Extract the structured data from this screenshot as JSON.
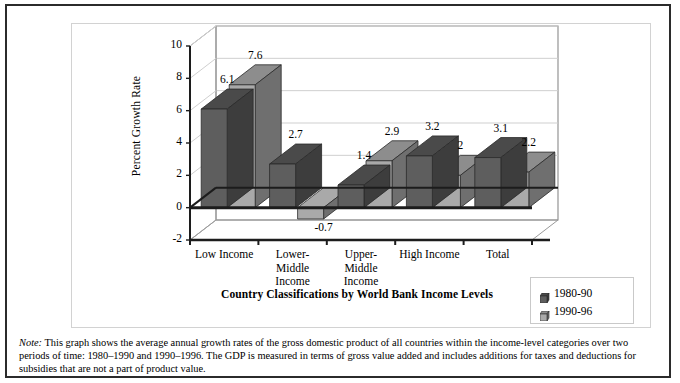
{
  "figure": {
    "note_prefix": "Note:",
    "note_text": " This graph shows the average annual growth rates of the gross domestic product of all countries within the income-level categories over two periods of time: 1980–1990 and 1990–1996. The GDP is measured in terms of gross value added and includes additions for taxes and deductions for subsidies that are not a part of product value."
  },
  "colors": {
    "series1_front": "#5e5e5e",
    "series1_top": "#4a4a4a",
    "series1_side": "#3d3d3d",
    "series2_front": "#a9a9a9",
    "series2_top": "#8d8d8d",
    "series2_side": "#6f6f6f",
    "axis": "#1c1c1c",
    "grid": "#cfcfcf",
    "wall": "#ffffff",
    "frame": "#2b2b2b"
  },
  "chart_data": {
    "type": "bar",
    "title": "Country Classifications by World Bank Income Levels",
    "xlabel": "Country Classifications by World Bank Income Levels",
    "ylabel": "Percent Growth Rate",
    "ylim": [
      -2,
      10
    ],
    "ytick_step": 2,
    "yticks": [
      "10",
      "8",
      "6",
      "4",
      "2",
      "0",
      "-2"
    ],
    "ytick_values": [
      10,
      8,
      6,
      4,
      2,
      0,
      -2
    ],
    "grid": true,
    "legend_position": "bottom-right",
    "categories": [
      "Low Income",
      "Lower-Middle Income",
      "Upper-Middle Income",
      "High Income",
      "Total"
    ],
    "category_label_lines": [
      [
        "Low Income"
      ],
      [
        "Lower-",
        "Middle",
        "Income"
      ],
      [
        "Upper-",
        "Middle",
        "Income"
      ],
      [
        "High Income"
      ],
      [
        "Total"
      ]
    ],
    "series": [
      {
        "name": "1980-90",
        "values": [
          6.1,
          2.7,
          1.4,
          3.2,
          3.1
        ],
        "labels": [
          "6.1",
          "2.7",
          "1.4",
          "3.2",
          "3.1"
        ]
      },
      {
        "name": "1990-96",
        "values": [
          7.6,
          -0.7,
          2.9,
          2.0,
          2.2
        ],
        "labels": [
          "7.6",
          "-0.7",
          "2.9",
          "2",
          "2.2"
        ]
      }
    ]
  }
}
